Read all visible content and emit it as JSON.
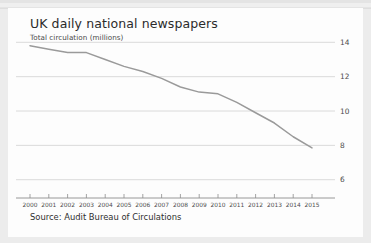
{
  "card": {
    "title": "UK daily national newspapers",
    "subtitle": "Total circulation (millions)",
    "source": "Source: Audit Bureau of Circulations"
  },
  "chart_data": {
    "type": "line",
    "title": "UK daily national newspapers",
    "subtitle": "Total circulation (millions)",
    "xlabel": "",
    "ylabel": "Total circulation (millions)",
    "categories": [
      "2000",
      "2001",
      "2002",
      "2003",
      "2004",
      "2005",
      "2006",
      "2007",
      "2008",
      "2009",
      "2010",
      "2011",
      "2012",
      "2013",
      "2014",
      "2015"
    ],
    "values": [
      13.8,
      13.6,
      13.4,
      13.4,
      13.0,
      12.6,
      12.3,
      11.9,
      11.4,
      11.1,
      11.0,
      10.5,
      9.9,
      9.3,
      8.5,
      7.85
    ],
    "series": [
      {
        "name": "Total circulation",
        "values": [
          13.8,
          13.6,
          13.4,
          13.4,
          13.0,
          12.6,
          12.3,
          11.9,
          11.4,
          11.1,
          11.0,
          10.5,
          9.9,
          9.3,
          8.5,
          7.85
        ]
      }
    ],
    "yticks": [
      14,
      12,
      10,
      8,
      6
    ],
    "ylim": [
      5.4,
      14.6
    ],
    "xlim": [
      "2000",
      "2015"
    ],
    "grid": true,
    "legend": false,
    "line_color": "#9a9a9a",
    "grid_color": "#d6d6d6",
    "axis_color": "#8d8d8d"
  },
  "colors": {
    "page_background": "#ececec",
    "card_background": "#fdfdfd",
    "title_text": "#2b2b2b",
    "body_text": "#4a4a4a"
  }
}
